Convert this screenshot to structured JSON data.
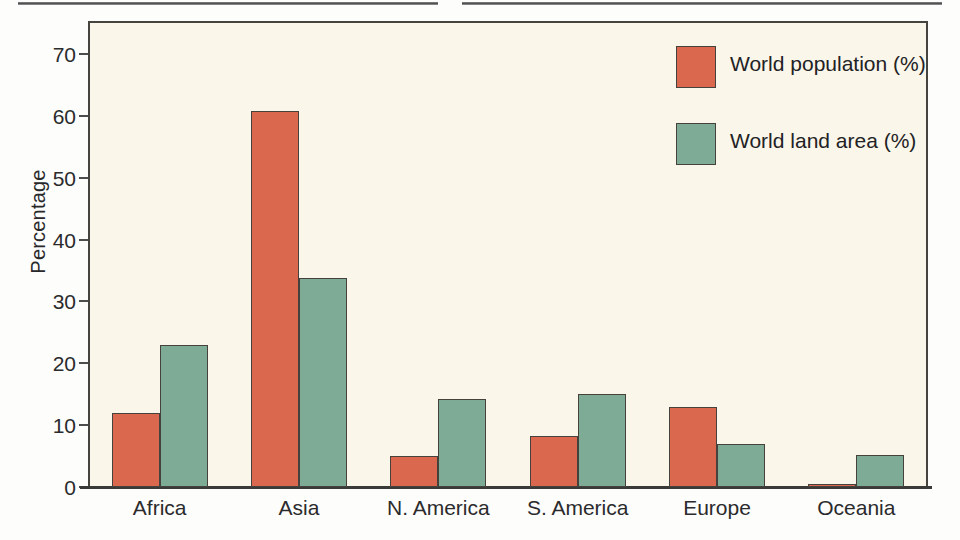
{
  "figure": {
    "background": "#faf6ea",
    "frame_color": "#46443f"
  },
  "colors": {
    "population": "#d9684e",
    "land_area": "#7dab96",
    "plot_background": "#faf6ea",
    "axis": "#3a3a38",
    "text": "#2b2b2d"
  },
  "legend": {
    "position": "top-right",
    "entries": [
      {
        "label": "World population (%)",
        "color": "#d9684e",
        "swatch": "population-swatch"
      },
      {
        "label": "World land area (%)",
        "color": "#7dab96",
        "swatch": "land-area-swatch"
      }
    ]
  },
  "axes": {
    "y_title": "Percentage",
    "y_ticks": [
      "70",
      "60",
      "50",
      "40",
      "30",
      "20",
      "10",
      "0"
    ],
    "x_ticks": [
      "Africa",
      "Asia",
      "N. America",
      "S. America",
      "Europe",
      "Oceania"
    ]
  },
  "chart_data": {
    "type": "bar",
    "title": "",
    "xlabel": "",
    "ylabel": "Percentage",
    "ylim": [
      0,
      75
    ],
    "yticks": [
      0,
      10,
      20,
      30,
      40,
      50,
      60,
      70
    ],
    "grid": false,
    "legend_position": "top-right",
    "categories": [
      "Africa",
      "Asia",
      "N. America",
      "S. America",
      "Europe",
      "Oceania"
    ],
    "series": [
      {
        "name": "World population (%)",
        "color": "#d9684e",
        "values": [
          12,
          60.7,
          5,
          8.2,
          13,
          0.5
        ]
      },
      {
        "name": "World land area (%)",
        "color": "#7dab96",
        "values": [
          23,
          33.8,
          14.2,
          15,
          7,
          5.2
        ]
      }
    ]
  }
}
